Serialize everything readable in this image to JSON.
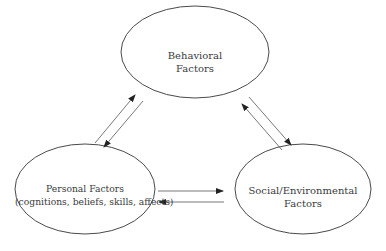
{
  "diagram": {
    "type": "triadic-reciprocal-causation",
    "nodes": {
      "behavioral": {
        "line1": "Behavioral",
        "line2": "Factors"
      },
      "personal": {
        "line1": "Personal Factors",
        "line2": "(cognitions, beliefs, skills, affects)"
      },
      "environmental": {
        "line1": "Social/Environmental",
        "line2": "Factors"
      }
    },
    "edges": [
      {
        "from": "personal",
        "to": "behavioral",
        "direction": "bidirectional"
      },
      {
        "from": "behavioral",
        "to": "environmental",
        "direction": "bidirectional"
      },
      {
        "from": "personal",
        "to": "environmental",
        "direction": "bidirectional"
      }
    ],
    "colors": {
      "stroke": "#4a4a4a",
      "text": "#3a3a3a",
      "background": "#ffffff"
    }
  }
}
